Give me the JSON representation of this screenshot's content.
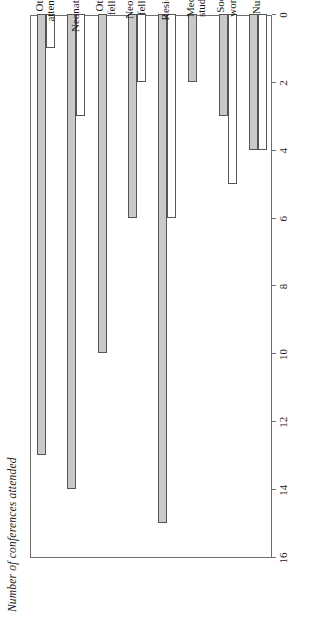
{
  "chart_data": {
    "type": "bar",
    "orientation": "horizontal",
    "title": "",
    "xlabel": "",
    "ylabel": "Number of conferences attended",
    "ylim": [
      0,
      16
    ],
    "yticks": [
      0,
      2,
      4,
      6,
      8,
      10,
      12,
      14,
      16
    ],
    "axis_reversed": true,
    "grid": false,
    "legend_position": "bottom-left",
    "categories": [
      "Other\nattendings",
      "Neonatologists",
      "Other\nfellows",
      "Neonatal\nfellows",
      "Residents",
      "Medical\nstudents",
      "Social\nworkers",
      "Nurses"
    ],
    "series": [
      {
        "name": "Randolph Nursery",
        "color": "#c9c9c9",
        "values": [
          13,
          14,
          10,
          6,
          15,
          2,
          3,
          4
        ]
      },
      {
        "name": "General Nursery",
        "color": "#ffffff",
        "values": [
          1,
          3,
          0,
          2,
          6,
          0,
          5,
          4
        ]
      }
    ]
  },
  "axis": {
    "ylabel": "Number of conferences attended",
    "tick_labels": [
      "16",
      "14",
      "12",
      "10",
      "8",
      "6",
      "4",
      "2",
      "0"
    ]
  },
  "legend": {
    "items": [
      {
        "label": "Randolph Nursery",
        "swatch": "randolph"
      },
      {
        "label": "General Nursery",
        "swatch": "general"
      }
    ]
  }
}
